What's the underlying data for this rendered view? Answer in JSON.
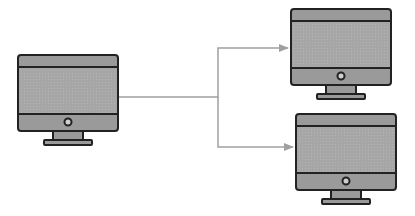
{
  "diagram": {
    "type": "network-distribution",
    "colors": {
      "background": "#ffffff",
      "monitor_body": "#9a9a9a",
      "monitor_screen": "#a8a8a8",
      "monitor_outline": "#222222",
      "connector": "#a0a0a0"
    },
    "nodes": [
      {
        "id": "source",
        "label": "source-computer",
        "x": 18,
        "y": 55,
        "w": 100,
        "h": 76
      },
      {
        "id": "target-top",
        "label": "target-computer-top",
        "x": 291,
        "y": 9,
        "w": 101,
        "h": 76
      },
      {
        "id": "target-bottom",
        "label": "target-computer-bottom",
        "x": 296,
        "y": 114,
        "w": 101,
        "h": 76
      }
    ],
    "edges": [
      {
        "from": "source",
        "to": "target-top"
      },
      {
        "from": "source",
        "to": "target-bottom"
      }
    ]
  }
}
